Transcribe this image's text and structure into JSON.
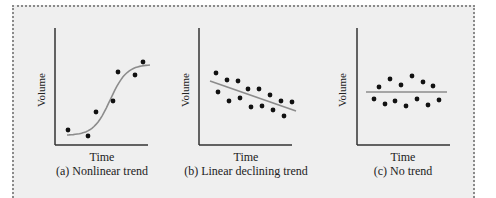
{
  "figure": {
    "panels": [
      {
        "id": "a",
        "caption": "(a) Nonlinear trend",
        "xlabel": "Time",
        "ylabel": "Volume",
        "trend": "sigmoid"
      },
      {
        "id": "b",
        "caption": "(b) Linear declining trend",
        "xlabel": "Time",
        "ylabel": "Volume",
        "trend": "linear-declining"
      },
      {
        "id": "c",
        "caption": "(c) No trend",
        "xlabel": "Time",
        "ylabel": "Volume",
        "trend": "flat"
      }
    ]
  },
  "colors": {
    "frame_background": "#efefef",
    "axis": "#333333",
    "point": "#111111",
    "trend_line": "#8c8c8c",
    "frame_border": "#8a8a8a"
  },
  "chart_data": [
    {
      "type": "scatter",
      "title": "(a) Nonlinear trend",
      "xlabel": "Time",
      "ylabel": "Volume",
      "grid": false,
      "points_px": [
        [
          68,
          130
        ],
        [
          88,
          136
        ],
        [
          96,
          112
        ],
        [
          113,
          101
        ],
        [
          118,
          72
        ],
        [
          135,
          75
        ],
        [
          143,
          62
        ]
      ],
      "trend_line": {
        "kind": "sigmoid",
        "from_px": [
          67,
          135
        ],
        "to_px": [
          150,
          65
        ]
      }
    },
    {
      "type": "scatter",
      "title": "(b) Linear declining trend",
      "xlabel": "Time",
      "ylabel": "Volume",
      "grid": false,
      "points_px": [
        [
          216,
          73
        ],
        [
          218,
          92
        ],
        [
          227,
          80
        ],
        [
          229,
          101
        ],
        [
          238,
          81
        ],
        [
          240,
          98
        ],
        [
          248,
          89
        ],
        [
          251,
          107
        ],
        [
          259,
          89
        ],
        [
          262,
          106
        ],
        [
          270,
          95
        ],
        [
          273,
          110
        ],
        [
          281,
          101
        ],
        [
          284,
          116
        ],
        [
          292,
          102
        ]
      ],
      "trend_line": {
        "kind": "linear",
        "from_px": [
          210,
          81
        ],
        "to_px": [
          296,
          111
        ]
      }
    },
    {
      "type": "scatter",
      "title": "(c) No trend",
      "xlabel": "Time",
      "ylabel": "Volume",
      "grid": false,
      "points_px": [
        [
          374,
          99
        ],
        [
          379,
          87
        ],
        [
          385,
          104
        ],
        [
          390,
          79
        ],
        [
          395,
          101
        ],
        [
          401,
          85
        ],
        [
          406,
          106
        ],
        [
          412,
          76
        ],
        [
          417,
          99
        ],
        [
          423,
          82
        ],
        [
          428,
          105
        ],
        [
          433,
          86
        ],
        [
          439,
          100
        ]
      ],
      "trend_line": {
        "kind": "flat",
        "from_px": [
          366,
          92
        ],
        "to_px": [
          447,
          92
        ]
      }
    }
  ]
}
